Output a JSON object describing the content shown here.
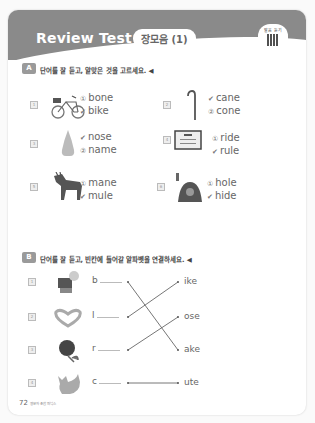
{
  "header": {
    "title": "Review Test [3]",
    "subtitle": "장모음 (1)",
    "qr_label": "발음 듣기"
  },
  "section_a": {
    "tag": "A",
    "instruction": "단어를 잘 듣고, 알맞은 것을 고르세요. ◀",
    "items": [
      {
        "num": "1",
        "picture": "bike",
        "options": [
          {
            "mark": "①",
            "text": "bone",
            "checked": false
          },
          {
            "mark": "✔",
            "text": "bike",
            "checked": true
          }
        ]
      },
      {
        "num": "2",
        "picture": "cane",
        "options": [
          {
            "mark": "✔",
            "text": "cane",
            "checked": true
          },
          {
            "mark": "②",
            "text": "cone",
            "checked": false
          }
        ]
      },
      {
        "num": "3",
        "picture": "nose",
        "options": [
          {
            "mark": "✔",
            "text": "nose",
            "checked": true
          },
          {
            "mark": "②",
            "text": "name",
            "checked": false
          }
        ]
      },
      {
        "num": "4",
        "picture": "rule",
        "options": [
          {
            "mark": "①",
            "text": "ride",
            "checked": false
          },
          {
            "mark": "✔",
            "text": "rule",
            "checked": true
          }
        ]
      },
      {
        "num": "5",
        "picture": "mule",
        "options": [
          {
            "mark": "①",
            "text": "mane",
            "checked": false
          },
          {
            "mark": "✔",
            "text": "mule",
            "checked": true
          }
        ]
      },
      {
        "num": "6",
        "picture": "hide",
        "options": [
          {
            "mark": "①",
            "text": "hole",
            "checked": false
          },
          {
            "mark": "✔",
            "text": "hide",
            "checked": true
          }
        ]
      }
    ]
  },
  "section_b": {
    "tag": "B",
    "instruction": "단어를 잘 듣고, 빈칸에 들어갈 알파벳을 연결하세요. ◀",
    "items": [
      {
        "num": "1",
        "picture": "bake",
        "letter": "b",
        "suffix": "ike"
      },
      {
        "num": "2",
        "picture": "love",
        "letter": "l",
        "suffix": "ose"
      },
      {
        "num": "3",
        "picture": "rose",
        "letter": "r",
        "suffix": "ake"
      },
      {
        "num": "4",
        "picture": "cute",
        "letter": "c",
        "suffix": "ute"
      }
    ]
  },
  "footer": {
    "page_number": "72",
    "book_title": "영문자 조합 파닉스"
  }
}
